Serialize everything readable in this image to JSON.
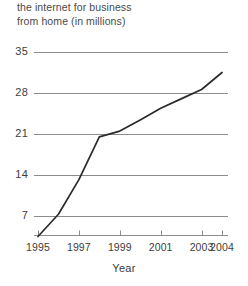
{
  "chart_data": {
    "type": "line",
    "title": "the internet for business\nfrom home (in millions)",
    "xlabel": "Year",
    "ylabel": "",
    "x": [
      1995,
      1996,
      1997,
      1998,
      1999,
      2000,
      2001,
      2002,
      2003,
      2004
    ],
    "values": [
      3.5,
      7.3,
      13.2,
      20.5,
      21.5,
      23.4,
      25.4,
      27.0,
      28.6,
      31.5
    ],
    "series": [
      {
        "name": "people using the internet for business from home",
        "values": [
          3.5,
          7.3,
          13.2,
          20.5,
          21.5,
          23.4,
          25.4,
          27.0,
          28.6,
          31.5
        ]
      }
    ],
    "x_tick_labels": [
      "1995",
      "1997",
      "1999",
      "2001",
      "2003",
      "2004"
    ],
    "x_tick_values": [
      1995,
      1997,
      1999,
      2001,
      2003,
      2004
    ],
    "y_tick_labels": [
      "35",
      "28",
      "21",
      "14",
      "7"
    ],
    "y_tick_values": [
      35,
      28,
      21,
      14,
      7
    ],
    "xlim": [
      1995,
      2004
    ],
    "ylim": [
      0,
      35
    ],
    "grid": "horizontal",
    "legend": "none",
    "line_color": "#2b2b2b",
    "grid_color": "#8c8c8c",
    "axis_color": "#8c8c8c",
    "background_color": "#ffffff"
  }
}
